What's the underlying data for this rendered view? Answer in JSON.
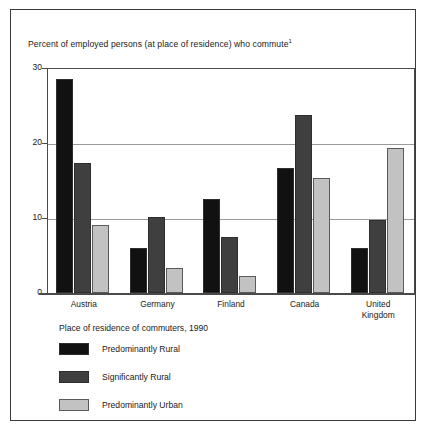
{
  "chart_data": {
    "type": "bar",
    "title": "Percent of employed persons (at place of residence) who commute",
    "title_footnote_marker": "1",
    "xlabel": "",
    "ylabel": "",
    "ylim": [
      0,
      30
    ],
    "yticks": [
      0,
      10,
      20,
      30
    ],
    "ytick_labels": [
      "0",
      "10",
      "20",
      "30"
    ],
    "grid": true,
    "grid_axis": "y",
    "legend_position": "below-plot",
    "legend_title": "Place of residence of commuters, 1990",
    "categories": [
      "Austria",
      "Germany",
      "Finland",
      "Canada",
      "United Kingdom"
    ],
    "category_label_lines": [
      [
        "Austria"
      ],
      [
        "Germany"
      ],
      [
        "Finland"
      ],
      [
        "Canada"
      ],
      [
        "United",
        "Kingdom"
      ]
    ],
    "series": [
      {
        "name": "Predominantly Rural",
        "color": "#111111",
        "values": [
          28.6,
          6.0,
          12.5,
          16.7,
          6.0
        ]
      },
      {
        "name": "Significantly Rural",
        "color": "#3f3f3f",
        "values": [
          17.3,
          10.2,
          7.5,
          23.7,
          9.7
        ]
      },
      {
        "name": "Predominantly Urban",
        "color": "#c2c2c2",
        "values": [
          9.1,
          3.4,
          2.3,
          15.4,
          19.3
        ]
      }
    ]
  },
  "colors": {
    "series_0": "#111111",
    "series_1": "#3f3f3f",
    "series_2": "#c2c2c2",
    "gridline": "#9a9a9a",
    "axis": "#4a4a4a",
    "frame_border": "#3a3a3a",
    "text": "#1a1a1a",
    "background": "#ffffff"
  }
}
